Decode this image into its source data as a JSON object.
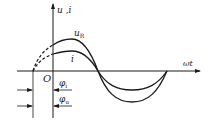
{
  "diagram": {
    "axes": {
      "y_label": "u ,i",
      "x_label": "ωt",
      "origin_label": "O"
    },
    "curves": [
      {
        "name": "u_R",
        "label_main": "u",
        "label_sub": "R",
        "amplitude_px": 32
      },
      {
        "name": "i",
        "label_main": "i",
        "label_sub": "",
        "amplitude_px": 20
      }
    ],
    "phase_labels": [
      {
        "name": "phi_i",
        "label_main": "φ",
        "label_sub": "i"
      },
      {
        "name": "phi_u",
        "label_main": "φ",
        "label_sub": "u"
      }
    ],
    "colors": {
      "ink": "#1a1a1a",
      "background": "#ffffff"
    }
  }
}
